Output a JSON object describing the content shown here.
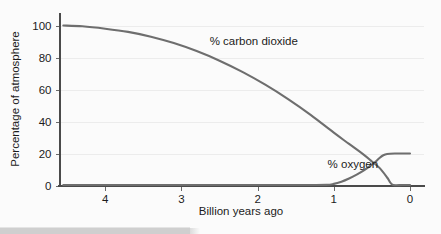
{
  "chart_data": {
    "type": "line",
    "title": "",
    "xlabel": "Billion years ago",
    "ylabel": "Percentage of atmosphere",
    "xlim": [
      4.6,
      -0.05
    ],
    "ylim": [
      0,
      105
    ],
    "x_ticks": [
      4,
      3,
      2,
      1,
      0
    ],
    "x_tick_labels": [
      "4",
      "3",
      "2",
      "1",
      "0"
    ],
    "y_ticks": [
      0,
      20,
      40,
      60,
      80,
      100
    ],
    "y_tick_labels": [
      "0",
      "20",
      "40",
      "60",
      "80",
      "100"
    ],
    "grid": true,
    "x_axis_inverted": true,
    "legend": "inline-annotations",
    "series": [
      {
        "name": "% carbon dioxide",
        "label": "% carbon dioxide",
        "color": "#6e6e6e",
        "label_x": 2.05,
        "label_y": 88,
        "x": [
          4.55,
          4.3,
          4.0,
          3.7,
          3.4,
          3.1,
          2.8,
          2.5,
          2.2,
          1.9,
          1.6,
          1.3,
          1.0,
          0.8,
          0.6,
          0.5,
          0.4,
          0.3,
          0.26,
          0.22,
          0.1,
          0.0
        ],
        "y": [
          100,
          99.5,
          98,
          96,
          93,
          89,
          84,
          78,
          71,
          63,
          54,
          44,
          33,
          26,
          19,
          15,
          11,
          5,
          2,
          0.3,
          0.3,
          0.3
        ]
      },
      {
        "name": "% oxygen",
        "label": "% oxygen",
        "color": "#6e6e6e",
        "label_x": 0.75,
        "label_y": 11,
        "x": [
          4.55,
          3.0,
          2.0,
          1.4,
          1.1,
          1.0,
          0.9,
          0.8,
          0.7,
          0.6,
          0.5,
          0.45,
          0.4,
          0.35,
          0.3,
          0.2,
          0.1,
          0.0
        ],
        "y": [
          0.3,
          0.3,
          0.3,
          0.3,
          0.4,
          1.0,
          2.4,
          4.4,
          6.8,
          9.6,
          13.0,
          15.0,
          17.2,
          18.9,
          19.7,
          20.0,
          20.0,
          20.0
        ]
      }
    ]
  },
  "figure": {
    "background_color": "#fbfbfb",
    "axis_color": "#4a4a4a",
    "grid_color": "#ececec",
    "curve_color": "#6e6e6e",
    "text_color": "#1c1c1c"
  }
}
